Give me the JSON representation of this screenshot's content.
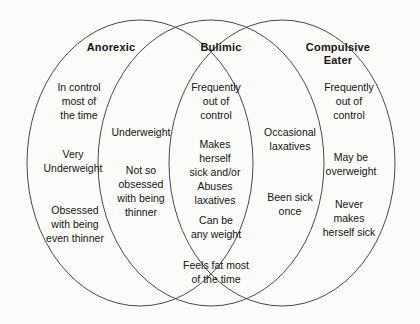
{
  "diagram": {
    "type": "venn-3-set",
    "background_color": "#fbfbfa",
    "stroke_color": "#4a4a4a",
    "text_color": "#141414",
    "sets": [
      {
        "id": "anorexic",
        "heading": "Anorexic",
        "exclusive_items": [
          "In control\nmost  of\nthe time",
          "Very\nUnderweight",
          "Obsessed\nwith being\neven thinner"
        ]
      },
      {
        "id": "bulimic",
        "heading": "Bulimic",
        "exclusive_items": [
          "Frequently\nout of\ncontrol",
          "Makes\nherself\nsick and/or\nAbuses\nlaxatives",
          "Can be\nany weight",
          "Feels fat most\nof the time"
        ]
      },
      {
        "id": "compulsive-eater",
        "heading": "Compulsive\nEater",
        "exclusive_items": [
          "Frequently\nout of\ncontrol",
          "May be\noverweight",
          "Never\nmakes\nherself sick"
        ]
      }
    ],
    "overlaps": [
      {
        "id": "anorexic-bulimic",
        "between": [
          "anorexic",
          "bulimic"
        ],
        "items": [
          "Underweight",
          "Not so\nobsessed\nwith being\nthinner"
        ]
      },
      {
        "id": "bulimic-compulsive",
        "between": [
          "bulimic",
          "compulsive-eater"
        ],
        "items": [
          "Occasional\nlaxatives",
          "Been sick\nonce"
        ]
      }
    ]
  }
}
